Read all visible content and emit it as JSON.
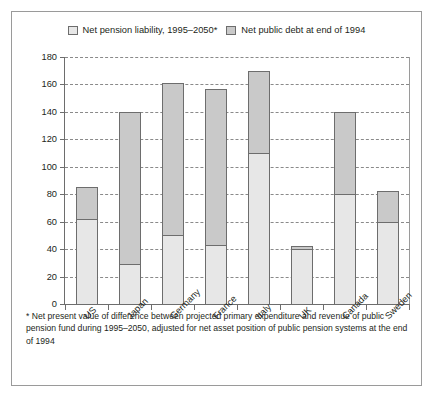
{
  "chart_data": {
    "type": "bar",
    "subtype": "stacked-vertical",
    "title": "",
    "xlabel": "",
    "ylabel": "",
    "ylim": [
      0,
      180
    ],
    "ytick_step": 20,
    "yticks": [
      0,
      20,
      40,
      60,
      80,
      100,
      120,
      140,
      160,
      180
    ],
    "grid": true,
    "grid_style": "dashed-horizontal",
    "legend_position": "top-center",
    "categories": [
      "US",
      "Japan",
      "Germany",
      "France",
      "Italy",
      "UK",
      "Canada",
      "Sweden"
    ],
    "series": [
      {
        "name": "Net pension liability, 1995–2050*",
        "color": "#e7e7e7",
        "values": [
          62,
          29,
          50,
          43,
          110,
          40,
          80,
          60
        ]
      },
      {
        "name": "Net public debt at end of 1994",
        "color": "#c9c9c9",
        "values": [
          23,
          111,
          111,
          114,
          60,
          2,
          60,
          22
        ]
      }
    ],
    "totals": [
      85,
      140,
      161,
      157,
      170,
      42,
      140,
      82
    ]
  },
  "legend": {
    "items": [
      {
        "label": "Net pension liability, 1995–2050*",
        "swatch": "light-grey-swatch"
      },
      {
        "label": "Net public debt at end of 1994",
        "swatch": "dark-grey-swatch"
      }
    ]
  },
  "axis": {
    "y_tick_labels": [
      "180",
      "160",
      "140",
      "120",
      "100",
      "80",
      "60",
      "40",
      "20",
      "0"
    ],
    "x_tick_labels": [
      "US",
      "Japan",
      "Germany",
      "France",
      "Italy",
      "UK",
      "Canada",
      "Sweden"
    ]
  },
  "footnote": {
    "text": "* Net present value of difference between projected primary expenditure and revenue of public pension fund during 1995–2050, adjusted for net asset position of public pension systems at the end of 1994"
  },
  "colors": {
    "series_light": "#e7e7e7",
    "series_dark": "#c9c9c9",
    "outline": "#6d6d6d",
    "border": "#9a9a9a",
    "background": "#ffffff",
    "text": "#231f20"
  }
}
